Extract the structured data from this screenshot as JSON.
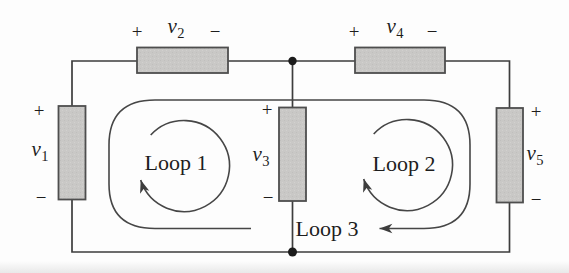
{
  "figure": {
    "type": "circuit-diagram",
    "colors": {
      "wire": "#3d3d3d",
      "loop_stroke": "#464646",
      "component_fill": "#c9c8c6",
      "component_border": "#4e4e4e",
      "text": "#1d1d1d",
      "background": "#fdfdfd"
    }
  },
  "components": [
    {
      "id": "v1",
      "base": "v",
      "sub": "1",
      "plus": "+",
      "minus": "−",
      "orientation": "vertical"
    },
    {
      "id": "v2",
      "base": "v",
      "sub": "2",
      "plus": "+",
      "minus": "−",
      "orientation": "horizontal"
    },
    {
      "id": "v3",
      "base": "v",
      "sub": "3",
      "plus": "+",
      "minus": "−",
      "orientation": "vertical"
    },
    {
      "id": "v4",
      "base": "v",
      "sub": "4",
      "plus": "+",
      "minus": "−",
      "orientation": "horizontal"
    },
    {
      "id": "v5",
      "base": "v",
      "sub": "5",
      "plus": "+",
      "minus": "−",
      "orientation": "vertical"
    }
  ],
  "loops": [
    {
      "label": "Loop 1",
      "direction": "clockwise"
    },
    {
      "label": "Loop 2",
      "direction": "clockwise"
    },
    {
      "label": "Loop 3",
      "direction": "clockwise"
    }
  ]
}
